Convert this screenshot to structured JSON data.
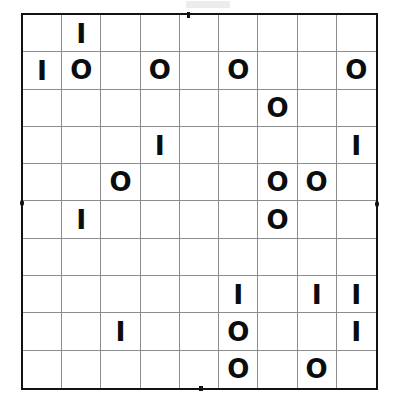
{
  "puzzle": {
    "type": "binary-grid-puzzle",
    "columns": 9,
    "rows": 10,
    "symbol_one": "I",
    "symbol_zero": "O",
    "empty": "",
    "border_color": "#111214",
    "gridline_color": "#8c8d90",
    "glyph_color": "#0b0c0e",
    "background_color": "#ffffff",
    "cells": [
      [
        "",
        "I",
        "",
        "",
        "",
        "",
        "",
        "",
        ""
      ],
      [
        "I",
        "O",
        "",
        "O",
        "",
        "O",
        "",
        "",
        "O"
      ],
      [
        "",
        "",
        "",
        "",
        "",
        "",
        "O",
        "",
        ""
      ],
      [
        "",
        "",
        "",
        "I",
        "",
        "",
        "",
        "",
        "I"
      ],
      [
        "",
        "",
        "O",
        "",
        "",
        "",
        "O",
        "O",
        ""
      ],
      [
        "",
        "I",
        "",
        "",
        "",
        "",
        "O",
        "",
        ""
      ],
      [
        "",
        "",
        "",
        "",
        "",
        "",
        "",
        "",
        ""
      ],
      [
        "",
        "",
        "",
        "",
        "",
        "I",
        "",
        "I",
        "I"
      ],
      [
        "",
        "",
        "I",
        "",
        "",
        "O",
        "",
        "",
        "I"
      ],
      [
        "",
        "",
        "",
        "",
        "",
        "O",
        "",
        "O",
        ""
      ]
    ]
  }
}
